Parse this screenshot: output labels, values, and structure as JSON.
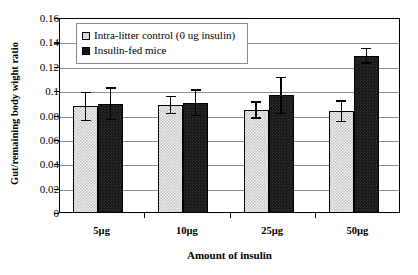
{
  "chart_data": {
    "type": "bar",
    "title": "",
    "xlabel": "Amount of insulin",
    "ylabel": "Gut/remaining body wight ratio",
    "categories": [
      "5µg",
      "10µg",
      "25µg",
      "50µg"
    ],
    "ylim": [
      0,
      0.16
    ],
    "yticks": [
      "0",
      "0.02",
      "0.04",
      "0.06",
      "0.08",
      "0.1",
      "0.12",
      "0.14",
      "0.16"
    ],
    "ytick_values": [
      0,
      0.02,
      0.04,
      0.06,
      0.08,
      0.1,
      0.12,
      0.14,
      0.16
    ],
    "grid": true,
    "legend_position": "top-left-inside",
    "series": [
      {
        "name": "Intra-litter control (0 ug insulin)",
        "color": "#c9c9c9",
        "pattern": "checkered",
        "values": [
          0.0875,
          0.0885,
          0.0845,
          0.0835
        ],
        "errors": [
          0.012,
          0.0075,
          0.007,
          0.009
        ]
      },
      {
        "name": "Insulin-fed mice",
        "color": "#1a1a1a",
        "pattern": "solid-dark",
        "values": [
          0.0895,
          0.0905,
          0.0965,
          0.129
        ],
        "errors": [
          0.0135,
          0.011,
          0.0155,
          0.0065
        ]
      }
    ]
  },
  "legend": {
    "items": [
      {
        "label": "Intra-litter control (0 ug insulin)"
      },
      {
        "label": "Insulin-fed mice"
      }
    ]
  },
  "axes": {
    "y_title": "Gut/remaining body wight ratio",
    "x_title": "Amount of insulin"
  }
}
